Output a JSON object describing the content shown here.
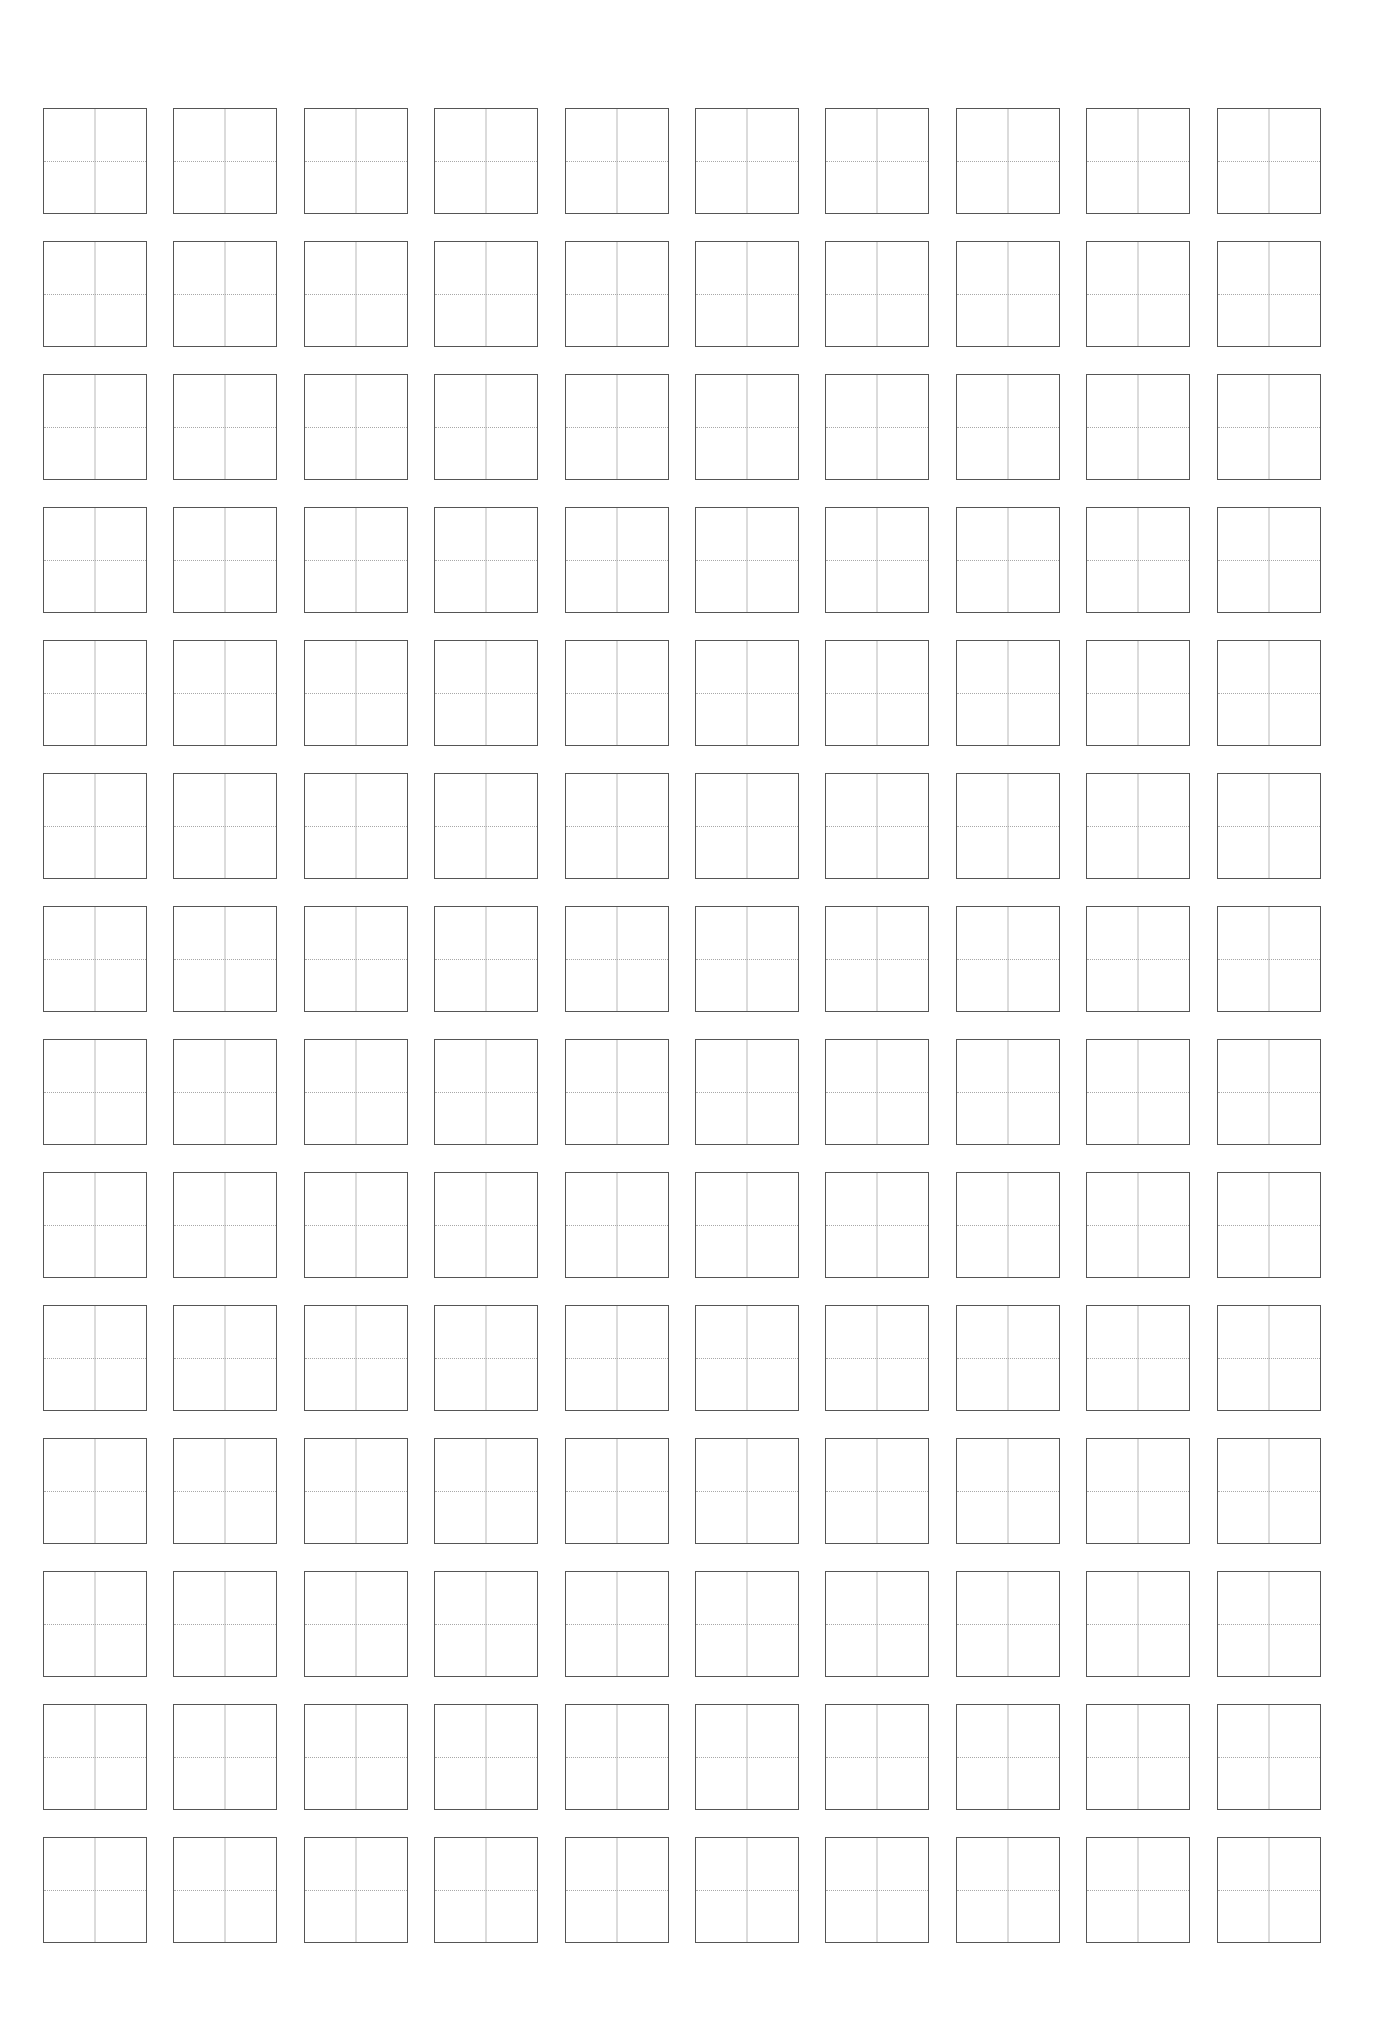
{
  "document": {
    "type": "character-practice-grid",
    "rows": 14,
    "columns": 10,
    "cell": {
      "style": "tian-zi-ge",
      "vertical_center_line": "solid",
      "horizontal_center_line": "dotted",
      "content": ""
    },
    "colors": {
      "background": "#ffffff",
      "cell_border": "#555555",
      "guide_line": "#b0b0b0"
    }
  }
}
